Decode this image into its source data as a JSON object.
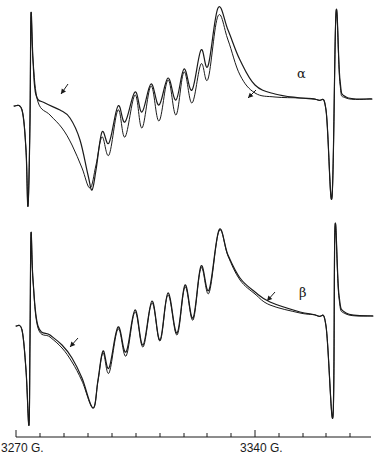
{
  "chart_data": {
    "type": "line",
    "title": "",
    "xlabel": "Magnetic field (G)",
    "ylabel": "",
    "grid": false,
    "x_axis": {
      "tick_labels": [
        {
          "label": "3270 G.",
          "value": 3270
        },
        {
          "label": "3340 G.",
          "value": 3340
        }
      ],
      "minor_tick_spacing_G": 7,
      "range_G": [
        3270,
        3374
      ]
    },
    "panels": [
      {
        "name": "alpha",
        "label": "α",
        "description": "EPR derivative spectrum, two overlaid traces; arrows mark where traces diverge",
        "series": [
          {
            "name": "trace 1",
            "points_px": [
              [
                14,
                106
              ],
              [
                22,
                110
              ],
              [
                26,
                150
              ],
              [
                28,
                206
              ],
              [
                30,
                120
              ],
              [
                31,
                14
              ],
              [
                33,
                60
              ],
              [
                36,
                95
              ],
              [
                45,
                103
              ],
              [
                60,
                110
              ],
              [
                70,
                118
              ],
              [
                80,
                140
              ],
              [
                88,
                175
              ],
              [
                92,
                190
              ],
              [
                96,
                170
              ],
              [
                102,
                132
              ],
              [
                109,
                143
              ],
              [
                118,
                106
              ],
              [
                125,
                122
              ],
              [
                135,
                92
              ],
              [
                142,
                112
              ],
              [
                151,
                84
              ],
              [
                159,
                105
              ],
              [
                168,
                78
              ],
              [
                176,
                100
              ],
              [
                184,
                69
              ],
              [
                192,
                90
              ],
              [
                201,
                50
              ],
              [
                208,
                66
              ],
              [
                218,
                8
              ],
              [
                228,
                30
              ],
              [
                240,
                60
              ],
              [
                255,
                85
              ],
              [
                275,
                94
              ],
              [
                300,
                98
              ],
              [
                318,
                100
              ],
              [
                326,
                110
              ],
              [
                332,
                197
              ],
              [
                336,
                13
              ],
              [
                340,
                80
              ],
              [
                346,
                97
              ],
              [
                372,
                99
              ]
            ]
          },
          {
            "name": "trace 2",
            "points_px": [
              [
                14,
                106
              ],
              [
                22,
                110
              ],
              [
                26,
                150
              ],
              [
                28,
                206
              ],
              [
                30,
                120
              ],
              [
                31,
                14
              ],
              [
                33,
                60
              ],
              [
                38,
                102
              ],
              [
                50,
                115
              ],
              [
                62,
                128
              ],
              [
                72,
                145
              ],
              [
                82,
                168
              ],
              [
                90,
                188
              ],
              [
                96,
                165
              ],
              [
                102,
                137
              ],
              [
                109,
                155
              ],
              [
                118,
                110
              ],
              [
                125,
                137
              ],
              [
                135,
                95
              ],
              [
                142,
                128
              ],
              [
                151,
                86
              ],
              [
                159,
                121
              ],
              [
                168,
                80
              ],
              [
                176,
                115
              ],
              [
                184,
                72
              ],
              [
                192,
                103
              ],
              [
                201,
                64
              ],
              [
                208,
                79
              ],
              [
                218,
                16
              ],
              [
                228,
                40
              ],
              [
                240,
                75
              ],
              [
                255,
                93
              ],
              [
                275,
                97
              ],
              [
                300,
                98
              ],
              [
                318,
                100
              ],
              [
                326,
                110
              ],
              [
                332,
                197
              ],
              [
                336,
                13
              ],
              [
                340,
                84
              ],
              [
                346,
                98
              ],
              [
                372,
                99
              ]
            ]
          }
        ],
        "arrows_px": [
          [
            [
              68,
              84
            ],
            [
              61,
              94
            ]
          ],
          [
            [
              256,
              90
            ],
            [
              248,
              98
            ]
          ]
        ]
      },
      {
        "name": "beta",
        "label": "β",
        "description": "EPR derivative spectrum, two overlaid traces nearly coincident; arrows mark small divergence",
        "series": [
          {
            "name": "trace 1",
            "points_px": [
              [
                16,
                326
              ],
              [
                22,
                330
              ],
              [
                26,
                370
              ],
              [
                29,
                425
              ],
              [
                30,
                340
              ],
              [
                31,
                234
              ],
              [
                33,
                280
              ],
              [
                38,
                326
              ],
              [
                50,
                335
              ],
              [
                62,
                345
              ],
              [
                72,
                358
              ],
              [
                82,
                378
              ],
              [
                93,
                408
              ],
              [
                98,
                380
              ],
              [
                103,
                351
              ],
              [
                109,
                368
              ],
              [
                118,
                327
              ],
              [
                126,
                352
              ],
              [
                135,
                310
              ],
              [
                143,
                345
              ],
              [
                152,
                301
              ],
              [
                160,
                340
              ],
              [
                168,
                293
              ],
              [
                177,
                333
              ],
              [
                185,
                285
              ],
              [
                193,
                318
              ],
              [
                201,
                266
              ],
              [
                209,
                290
              ],
              [
                219,
                230
              ],
              [
                228,
                255
              ],
              [
                240,
                278
              ],
              [
                255,
                292
              ],
              [
                270,
                302
              ],
              [
                300,
                312
              ],
              [
                318,
                316
              ],
              [
                326,
                326
              ],
              [
                333,
                416
              ],
              [
                335,
                227
              ],
              [
                339,
                295
              ],
              [
                346,
                313
              ],
              [
                373,
                316
              ]
            ]
          },
          {
            "name": "trace 2",
            "points_px": [
              [
                16,
                326
              ],
              [
                22,
                330
              ],
              [
                26,
                370
              ],
              [
                29,
                425
              ],
              [
                30,
                340
              ],
              [
                31,
                234
              ],
              [
                33,
                280
              ],
              [
                38,
                328
              ],
              [
                50,
                337
              ],
              [
                62,
                348
              ],
              [
                72,
                362
              ],
              [
                82,
                381
              ],
              [
                93,
                408
              ],
              [
                98,
                381
              ],
              [
                103,
                353
              ],
              [
                109,
                373
              ],
              [
                118,
                329
              ],
              [
                126,
                356
              ],
              [
                135,
                312
              ],
              [
                143,
                347
              ],
              [
                152,
                303
              ],
              [
                160,
                341
              ],
              [
                168,
                295
              ],
              [
                177,
                335
              ],
              [
                185,
                287
              ],
              [
                193,
                320
              ],
              [
                201,
                268
              ],
              [
                209,
                293
              ],
              [
                219,
                231
              ],
              [
                228,
                256
              ],
              [
                240,
                280
              ],
              [
                255,
                294
              ],
              [
                270,
                305
              ],
              [
                300,
                313
              ],
              [
                318,
                316
              ],
              [
                326,
                326
              ],
              [
                333,
                416
              ],
              [
                335,
                227
              ],
              [
                339,
                298
              ],
              [
                346,
                314
              ],
              [
                373,
                316
              ]
            ]
          }
        ],
        "arrows_px": [
          [
            [
              78,
              338
            ],
            [
              70,
              347
            ]
          ],
          [
            [
              275,
              292
            ],
            [
              267,
              301
            ]
          ]
        ]
      }
    ]
  },
  "labels": {
    "alpha": "α",
    "beta": "β",
    "tick_left": "3270 G.",
    "tick_right": "3340 G."
  },
  "axis": {
    "y_px": 437,
    "x_start_px": 16,
    "x_end_px": 371,
    "tick_x_px": [
      16,
      40,
      64,
      88,
      112,
      136,
      160,
      184,
      207,
      231,
      255,
      279,
      303,
      326,
      350
    ],
    "major_tick_x_px": 255
  }
}
